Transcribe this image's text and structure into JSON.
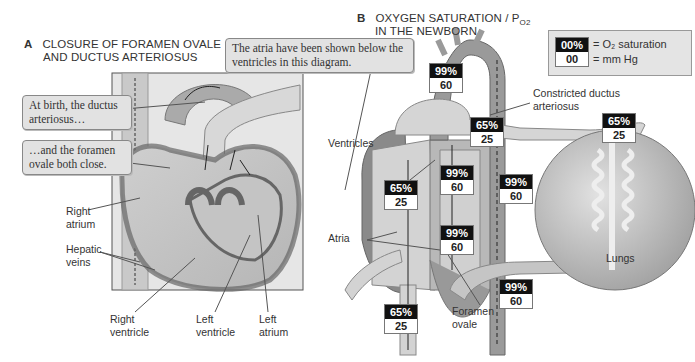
{
  "panel_a": {
    "letter": "A",
    "title_line1": "CLOSURE OF FORAMEN OVALE",
    "title_line2": "AND DUCTUS ARTERIOSUS",
    "callouts": {
      "ductus": "At birth, the ductus arteriosus…",
      "foramen": "…and the foramen ovale both close."
    },
    "labels": {
      "right_atrium": "Right atrium",
      "hepatic_veins": "Hepatic veins",
      "right_ventricle": "Right ventricle",
      "left_ventricle": "Left ventricle",
      "left_atrium": "Left atrium"
    }
  },
  "center_callout": "The atria have been shown below the ventricles in this diagram.",
  "panel_b": {
    "letter": "B",
    "title_line1": "OXYGEN SATURATION / P",
    "title_sub": "O2",
    "title_line2": "IN THE NEWBORN",
    "legend": {
      "sat_sample": "00%",
      "mm_sample": "00",
      "sat_text": "= O₂ saturation",
      "mm_text": "= mm Hg"
    },
    "labels": {
      "constricted_ductus": "Constricted ductus arteriosus",
      "ventricles": "Ventricles",
      "atria": "Atria",
      "lungs": "Lungs",
      "foramen_ovale": "Foramen ovale"
    },
    "values": [
      {
        "id": "aorta",
        "sat": "99%",
        "mm": "60"
      },
      {
        "id": "pulm-artery",
        "sat": "65%",
        "mm": "25"
      },
      {
        "id": "lung-in",
        "sat": "65%",
        "mm": "25"
      },
      {
        "id": "right-ventricle",
        "sat": "65%",
        "mm": "25"
      },
      {
        "id": "left-ventricle",
        "sat": "99%",
        "mm": "60"
      },
      {
        "id": "descending-aorta",
        "sat": "99%",
        "mm": "60"
      },
      {
        "id": "left-atrium",
        "sat": "99%",
        "mm": "60"
      },
      {
        "id": "descending-aorta-lower",
        "sat": "99%",
        "mm": "60"
      },
      {
        "id": "vena-cava",
        "sat": "65%",
        "mm": "25"
      }
    ]
  }
}
